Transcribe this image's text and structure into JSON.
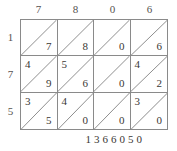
{
  "figure": {
    "name": "lattice-multiplication-grid",
    "line_color": "#8a8a8a",
    "text_color": "#3a3734"
  },
  "top_digits": [
    "7",
    "8",
    "0",
    "6"
  ],
  "left_digits": [
    "1",
    "7",
    "5"
  ],
  "cells": [
    [
      {
        "tens": "",
        "ones": "7"
      },
      {
        "tens": "",
        "ones": "8"
      },
      {
        "tens": "",
        "ones": "0"
      },
      {
        "tens": "",
        "ones": "6"
      }
    ],
    [
      {
        "tens": "4",
        "ones": "9"
      },
      {
        "tens": "5",
        "ones": "6"
      },
      {
        "tens": "",
        "ones": "0"
      },
      {
        "tens": "4",
        "ones": "2"
      }
    ],
    [
      {
        "tens": "3",
        "ones": "5"
      },
      {
        "tens": "4",
        "ones": "0"
      },
      {
        "tens": "",
        "ones": "0"
      },
      {
        "tens": "3",
        "ones": "0"
      }
    ]
  ],
  "result_digits": [
    "1",
    "3",
    "6",
    "6",
    "0",
    "5",
    "0"
  ]
}
